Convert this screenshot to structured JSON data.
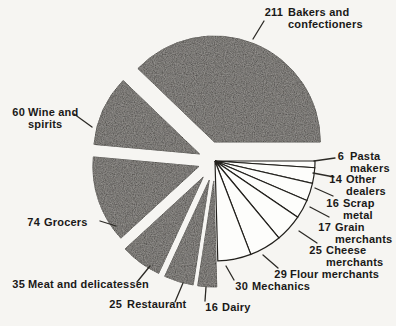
{
  "chart_data": {
    "type": "pie",
    "style": "exploded, scanned print figure, no title, no legend",
    "direction": "clockwise",
    "start_angle_deg": 0,
    "center": [
      215,
      161
    ],
    "radius_plain": 100,
    "radius_shaded": 106,
    "colors": {
      "background": "#f6f5f2",
      "shaded_fill": "#42403d",
      "plain_fill": "#fdfdfb",
      "stroke": "#15130f",
      "text": "#1a1918",
      "leader": "#2c2a26"
    },
    "slices": [
      {
        "value": 6,
        "label": "Pasta makers",
        "shaded": false,
        "explode": 0,
        "label_lines": [
          "Pasta",
          "makers"
        ],
        "num_right_x": 344,
        "text_x": 350,
        "label_y": 151,
        "leader": [
          314,
          161,
          335,
          158
        ]
      },
      {
        "value": 14,
        "label": "Other dealers",
        "shaded": false,
        "explode": 0,
        "label_lines": [
          "Other",
          "dealers"
        ],
        "num_right_x": 342,
        "text_x": 346,
        "label_y": 174,
        "leader": [
          313,
          173,
          334,
          177
        ]
      },
      {
        "value": 16,
        "label": "Scrap metal",
        "shaded": false,
        "explode": 0,
        "label_lines": [
          "Scrap",
          "metal"
        ],
        "num_right_x": 339,
        "text_x": 343,
        "label_y": 198,
        "leader": [
          315,
          188,
          333,
          196
        ]
      },
      {
        "value": 17,
        "label": "Grain merchants",
        "shaded": false,
        "explode": 0,
        "label_lines": [
          "Grain",
          "merchants"
        ],
        "num_right_x": 331,
        "text_x": 335,
        "label_y": 222,
        "leader": [
          310,
          207,
          329,
          217
        ]
      },
      {
        "value": 25,
        "label": "Cheese merchants",
        "shaded": false,
        "explode": 0,
        "label_lines": [
          "Cheese",
          "merchants"
        ],
        "num_right_x": 322,
        "text_x": 326,
        "label_y": 245,
        "leader": [
          299,
          231,
          317,
          243
        ]
      },
      {
        "value": 29,
        "label": "Flour merchants",
        "shaded": false,
        "explode": 0,
        "label_lines": [
          "Flour merchants"
        ],
        "num_right_x": 287,
        "text_x": 290,
        "label_y": 269,
        "leader": [
          263,
          255,
          278,
          268
        ]
      },
      {
        "value": 30,
        "label": "Mechanics",
        "shaded": false,
        "explode": 0,
        "label_lines": [
          "Mechanics"
        ],
        "num_right_x": 248,
        "text_x": 252,
        "label_y": 281,
        "leader": [
          226,
          266,
          234,
          280
        ]
      },
      {
        "value": 16,
        "label": "Dairy",
        "shaded": true,
        "explode": 20,
        "label_lines": [
          "Dairy"
        ],
        "num_right_x": 218,
        "text_x": 222,
        "label_y": 302,
        "leader": [
          206,
          287,
          205,
          301
        ]
      },
      {
        "value": 25,
        "label": "Restaurant",
        "shaded": true,
        "explode": 20,
        "label_lines": [
          "Restaurant"
        ],
        "num_right_x": 122,
        "text_x": 127,
        "label_y": 299,
        "leader": [
          183,
          283,
          175,
          302
        ]
      },
      {
        "value": 35,
        "label": "Meat and delicatessen",
        "shaded": true,
        "explode": 20,
        "label_lines": [
          "Meat and delicatessen"
        ],
        "num_right_x": 25,
        "text_x": 28,
        "label_y": 279,
        "leader": [
          150,
          266,
          137,
          282
        ]
      },
      {
        "value": 74,
        "label": "Grocers",
        "shaded": true,
        "explode": 17,
        "label_lines": [
          "Grocers"
        ],
        "num_right_x": 40,
        "text_x": 44,
        "label_y": 217,
        "leader": [
          116,
          226,
          100,
          221
        ]
      },
      {
        "value": 60,
        "label": "Wine and spirits",
        "shaded": true,
        "explode": 17,
        "label_lines": [
          "Wine and",
          "spirits"
        ],
        "num_right_x": 25,
        "text_x": 28,
        "label_y": 107,
        "leader": [
          92,
          127,
          74,
          114
        ]
      },
      {
        "value": 211,
        "label": "Bakers and confectioners",
        "shaded": true,
        "explode": 19,
        "explode_deg": 268,
        "label_lines": [
          "Bakers and",
          "confectioners"
        ],
        "num_right_x": 283,
        "text_x": 288,
        "label_y": 7,
        "leader": [
          253,
          39,
          264,
          21
        ]
      }
    ]
  }
}
